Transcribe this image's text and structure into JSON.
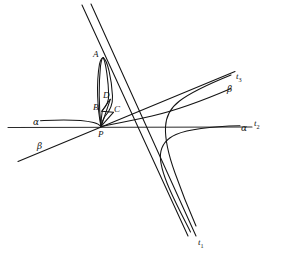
{
  "figure": {
    "kind": "geometric-diagram",
    "width": 283,
    "height": 260,
    "background_color": "#ffffff",
    "ink_color": "#141414"
  },
  "point_labels": [
    {
      "id": "A",
      "text": "A",
      "x": 93,
      "y": 50
    },
    {
      "id": "B",
      "text": "B",
      "x": 93,
      "y": 103
    },
    {
      "id": "C",
      "text": "C",
      "x": 114,
      "y": 105
    },
    {
      "id": "D",
      "text": "D",
      "x": 103,
      "y": 91
    },
    {
      "id": "P",
      "text": "P",
      "x": 98,
      "y": 130
    }
  ],
  "curve_labels": [
    {
      "id": "alpha-left",
      "text": "α",
      "x": 33,
      "y": 118
    },
    {
      "id": "alpha-right",
      "text": "α",
      "x": 241,
      "y": 124
    },
    {
      "id": "beta-left",
      "text": "β",
      "x": 37,
      "y": 142
    },
    {
      "id": "beta-right",
      "text": "β",
      "x": 227,
      "y": 85
    }
  ],
  "asymptote_labels": [
    {
      "id": "t1",
      "base": "t",
      "sub": "1",
      "x": 198,
      "y": 238
    },
    {
      "id": "t2",
      "base": "t",
      "sub": "2",
      "x": 254,
      "y": 119
    },
    {
      "id": "t3",
      "base": "t",
      "sub": "3",
      "x": 236,
      "y": 72
    }
  ],
  "geometry": {
    "common_point_P": {
      "x": 101,
      "y": 126
    },
    "point_A": {
      "x": 103,
      "y": 58
    },
    "point_B": {
      "x": 102,
      "y": 111
    },
    "point_C": {
      "x": 113,
      "y": 112
    },
    "point_D": {
      "x": 110,
      "y": 99
    },
    "line_t1": {
      "from": {
        "x": 91,
        "y": 4
      },
      "to": {
        "x": 196,
        "y": 236
      }
    },
    "line_t2": {
      "from": {
        "x": 8,
        "y": 127
      },
      "to": {
        "x": 253,
        "y": 127
      }
    },
    "line_t3": {
      "from": {
        "x": 18,
        "y": 161
      },
      "to": {
        "x": 235,
        "y": 71
      }
    },
    "curve_alpha": "branch passing through P, rising steeply to A, then returning; far branch asymptotic to t2 on the right and to t1 below",
    "curve_beta": "branch through P tangent near B and C; far branch asymptotic to t3 on the upper right and to t1 below"
  }
}
